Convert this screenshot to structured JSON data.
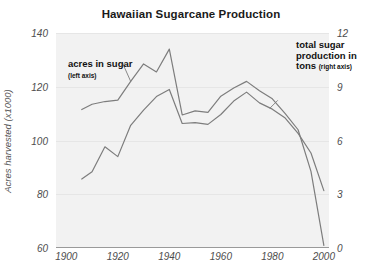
{
  "chart_data": {
    "type": "line",
    "title": "Hawaiian Sugarcane Production",
    "xlabel": "",
    "ylabel": "Acres harvested (x1000)",
    "ylabel_right": "",
    "grid": true,
    "legend_position": "inline-annotations",
    "xlim": [
      1896,
      2002
    ],
    "xticks": [
      1900,
      1920,
      1940,
      1960,
      1980,
      2000
    ],
    "ylim": [
      60,
      140
    ],
    "yticks": [
      60,
      80,
      100,
      120,
      140
    ],
    "ylim_right": [
      0,
      12
    ],
    "yticks_right": [
      0,
      3,
      6,
      9,
      12
    ],
    "series": [
      {
        "name": "acres in sugar",
        "axis": "left",
        "units": "thousand acres",
        "x": [
          1906,
          1910,
          1915,
          1920,
          1925,
          1930,
          1935,
          1940,
          1945,
          1950,
          1955,
          1960,
          1965,
          1970,
          1975,
          1980,
          1985,
          1990,
          1995,
          2000
        ],
        "y": [
          111.5,
          113.5,
          114.5,
          115.0,
          122.0,
          128.5,
          125.5,
          134.0,
          109.5,
          111.0,
          110.5,
          116.5,
          119.5,
          122.0,
          118.5,
          115.5,
          110.0,
          104.0,
          88.5,
          61.0
        ]
      },
      {
        "name": "total sugar production in tons",
        "axis": "right",
        "units": "million tons",
        "x": [
          1906,
          1910,
          1915,
          1920,
          1925,
          1930,
          1935,
          1940,
          1945,
          1950,
          1955,
          1960,
          1965,
          1970,
          1975,
          1980,
          1985,
          1990,
          1995,
          2000
        ],
        "y": [
          3.85,
          4.25,
          5.65,
          5.1,
          6.85,
          7.7,
          8.45,
          8.85,
          6.95,
          7.0,
          6.9,
          7.45,
          8.2,
          8.7,
          8.1,
          7.75,
          7.25,
          6.4,
          5.3,
          3.2
        ]
      }
    ],
    "annotations": [
      {
        "id": "acres-in-sugar",
        "text": "acres in sugar",
        "subtext": "(left axis)",
        "series": "acres in sugar"
      },
      {
        "id": "total-sugar-production",
        "text": "total sugar production in tons",
        "subtext": "(right axis)",
        "series": "total sugar production in tons"
      }
    ],
    "colors": {
      "line": "#7d7d7d",
      "plot_background": "#f2f2f2",
      "gridline": "#e6e6e6",
      "axis": "#9a9a9a",
      "text": "#1a1a1a",
      "tick_text": "#4d4d4d"
    }
  },
  "annotations_display": {
    "acres": {
      "line1": "acres in sugar",
      "line2": "(left axis)"
    },
    "sugar": {
      "line1": "total sugar",
      "line2": "production in",
      "line3": "tons",
      "line4": "(right axis)"
    }
  },
  "axis_labels": {
    "left_title": "Acres harvested (x1000)",
    "left_ticks": [
      "140",
      "120",
      "100",
      "80",
      "60"
    ],
    "right_ticks": [
      "12",
      "9",
      "6",
      "3",
      "0"
    ],
    "x_ticks": [
      "1900",
      "1920",
      "1940",
      "1960",
      "1980",
      "2000"
    ]
  }
}
